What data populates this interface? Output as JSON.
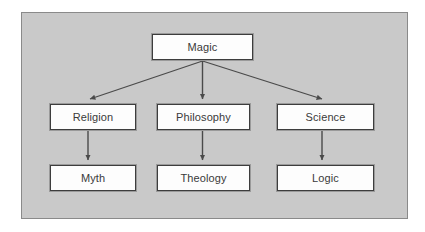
{
  "diagram": {
    "background_color": "#c9c9c9",
    "frame_border_color": "#8a8a8a",
    "node_fill_color": "#fdfdfd",
    "node_border_color": "#3d3d3d",
    "connector_color": "#4a4a4a",
    "text_color": "#3a3a3a",
    "nodes": [
      {
        "id": "magic",
        "label": "Magic",
        "level": 0,
        "x": 152,
        "y": 34,
        "w": 101,
        "h": 26
      },
      {
        "id": "religion",
        "label": "Religion",
        "level": 1,
        "x": 50,
        "y": 104,
        "w": 86,
        "h": 26
      },
      {
        "id": "philosophy",
        "label": "Philosophy",
        "level": 1,
        "x": 157,
        "y": 104,
        "w": 93,
        "h": 26
      },
      {
        "id": "science",
        "label": "Science",
        "level": 1,
        "x": 277,
        "y": 104,
        "w": 97,
        "h": 26
      },
      {
        "id": "myth",
        "label": "Myth",
        "level": 2,
        "x": 50,
        "y": 165,
        "w": 86,
        "h": 26
      },
      {
        "id": "theology",
        "label": "Theology",
        "level": 2,
        "x": 157,
        "y": 165,
        "w": 93,
        "h": 26
      },
      {
        "id": "logic",
        "label": "Logic",
        "level": 2,
        "x": 277,
        "y": 165,
        "w": 97,
        "h": 26
      }
    ],
    "edges": [
      {
        "id": "magic-religion",
        "from": "magic",
        "to": "religion",
        "type": "diagonal-left"
      },
      {
        "id": "magic-philosophy",
        "from": "magic",
        "to": "philosophy",
        "type": "vertical"
      },
      {
        "id": "magic-science",
        "from": "magic",
        "to": "science",
        "type": "diagonal-right"
      },
      {
        "id": "religion-myth",
        "from": "religion",
        "to": "myth",
        "type": "vertical"
      },
      {
        "id": "philosophy-theology",
        "from": "philosophy",
        "to": "theology",
        "type": "vertical"
      },
      {
        "id": "science-logic",
        "from": "science",
        "to": "logic",
        "type": "vertical"
      }
    ]
  }
}
